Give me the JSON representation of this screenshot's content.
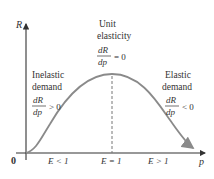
{
  "axes": {
    "y_label": "R",
    "x_label": "p",
    "origin_label": "0"
  },
  "regions": {
    "left": {
      "title_line1": "Inelastic",
      "title_line2": "demand",
      "deriv_num": "dR",
      "deriv_den": "dp",
      "relation": "> 0",
      "axis_label": "E < 1"
    },
    "center": {
      "title_line1": "Unit",
      "title_line2": "elasticity",
      "deriv_num": "dR",
      "deriv_den": "dp",
      "relation": "= 0",
      "axis_label": "E = 1"
    },
    "right": {
      "title_line1": "Elastic",
      "title_line2": "demand",
      "deriv_num": "dR",
      "deriv_den": "dp",
      "relation": "< 0",
      "axis_label": "E > 1"
    }
  },
  "colors": {
    "curve": "#8a8a8a",
    "axis": "#333333",
    "dashed": "#777777",
    "text": "#333333"
  }
}
